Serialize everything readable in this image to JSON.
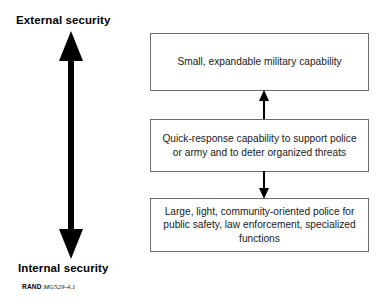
{
  "figure": {
    "type": "block-diagram",
    "title_visible": false,
    "background_color": "#ffffff"
  },
  "axis": {
    "orientation": "vertical",
    "arrow_style": "double-headed",
    "arrow_color": "#000000",
    "top_label": "External security",
    "bottom_label": "Internal security"
  },
  "boxes": [
    {
      "id": "military",
      "name": "small-expandable-military-capability",
      "text": "Small, expandable military capability",
      "lines": [
        "Small, expandable military capability"
      ],
      "position": "top",
      "border_color": "#6c6c6c",
      "fill_color": "#ffffff"
    },
    {
      "id": "quick-response",
      "name": "quick-response-capability",
      "text": "Quick-response capability to support police or army and to deter organized threats",
      "lines": [
        "Quick-response capability to support",
        "police or army and to deter",
        "organized threats"
      ],
      "position": "middle",
      "border_color": "#6c6c6c",
      "fill_color": "#ffffff"
    },
    {
      "id": "police",
      "name": "community-oriented-police",
      "text": "Large, light, community-oriented police for public safety, law enforcement, specialized functions",
      "lines": [
        "Large, light, community-oriented police",
        "for public safety, law enforcement,",
        "specialized functions"
      ],
      "position": "bottom",
      "border_color": "#6c6c6c",
      "fill_color": "#ffffff"
    }
  ],
  "connectors": [
    {
      "id": "quick-response-to-military",
      "from": "quick-response",
      "to": "military",
      "direction": "up",
      "arrowheads": 1,
      "color": "#000000"
    },
    {
      "id": "quick-response-to-police",
      "from": "quick-response",
      "to": "police",
      "direction": "down",
      "arrowheads": 1,
      "color": "#000000"
    }
  ],
  "caption": {
    "organization": "RAND",
    "identifier": "MG529-4.1",
    "full_text": "RAND MG529-4.1"
  }
}
